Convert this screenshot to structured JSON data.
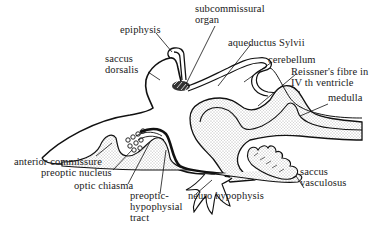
{
  "diagram": {
    "type": "anatomical sagittal section of brain",
    "stroke_color": "#111111",
    "fill_tissue": "#f4f4f4",
    "labels": {
      "epiphysis": "epiphysis",
      "subcommissural_organ_1": "subcommissural",
      "subcommissural_organ_2": "organ",
      "saccus_dorsalis_1": "saccus",
      "saccus_dorsalis_2": "dorsalis",
      "aqueductus": "aqueductus Sylvii",
      "cerebellum": "cerebellum",
      "reissner_1": "Reissner's fibre in",
      "reissner_2": "IV th ventricle",
      "medulla": "medulla",
      "anterior_commissure": "anterior commissure",
      "preoptic_nucleus": "preoptic nucleus",
      "optic_chiasma": "optic chiasma",
      "pht_1": "preoptic-",
      "pht_2": "hypophysial",
      "pht_3": "tract",
      "neuro_hypophysis": "neuro hypophysis",
      "saccus_vasculosus_1": "saccus",
      "saccus_vasculosus_2": "vasculosus"
    }
  }
}
